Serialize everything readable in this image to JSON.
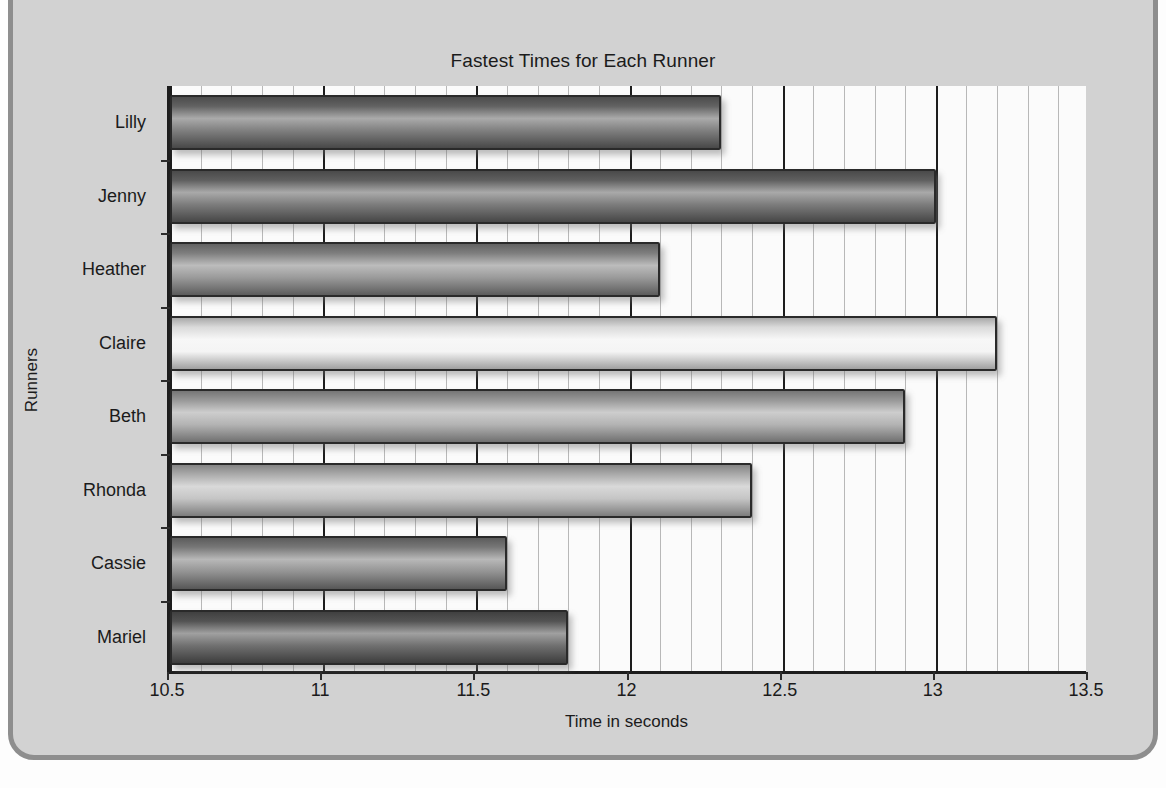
{
  "chart_data": {
    "type": "bar",
    "orientation": "horizontal",
    "title": "Fastest Times for Each Runner",
    "xlabel": "Time in seconds",
    "ylabel": "Runners",
    "categories": [
      "Lilly",
      "Jenny",
      "Heather",
      "Claire",
      "Beth",
      "Rhonda",
      "Cassie",
      "Mariel"
    ],
    "values": [
      12.3,
      13.0,
      12.1,
      13.2,
      12.9,
      12.4,
      11.6,
      11.8
    ],
    "xlim": [
      10.5,
      13.5
    ],
    "xticks": [
      "10.5",
      "11",
      "11.5",
      "12",
      "12.5",
      "13",
      "13.5"
    ],
    "xtick_values": [
      10.5,
      11,
      11.5,
      12,
      12.5,
      13,
      13.5
    ],
    "minor_tick_step": 0.1,
    "grid": true,
    "legend": null,
    "bar_colors": [
      "#6d6d6d",
      "#6a6a6a",
      "#8c8c8c",
      "#f2f2f2",
      "#a9a9a9",
      "#bdbdbd",
      "#848484",
      "#5c5c5c"
    ],
    "plot_background": "#fbfbfb",
    "frame_color": "#d2d2d2",
    "axis_color": "#1d1d1d"
  }
}
